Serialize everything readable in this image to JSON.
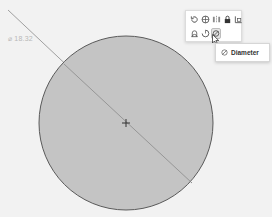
{
  "viewport": {
    "background": "#f2f2f2",
    "circle": {
      "cx": 126,
      "cy": 123,
      "r": 87,
      "fill": "#c4c4c4",
      "stroke": "#5a5a5a"
    },
    "diameter_line": {
      "x1": 8,
      "y1": 10,
      "x2": 192,
      "y2": 183,
      "color": "#8a8a8a"
    },
    "center_mark": "crosshair",
    "dimension_label": "⌀ 18.32"
  },
  "toolbar": {
    "row1": [
      {
        "icon": "rotate-icon"
      },
      {
        "icon": "globe-icon"
      },
      {
        "icon": "mirror-icon"
      },
      {
        "icon": "lock-icon"
      },
      {
        "icon": "scale-icon"
      }
    ],
    "row2": [
      {
        "icon": "radius-icon"
      },
      {
        "icon": "arc-icon"
      },
      {
        "icon": "diameter-icon",
        "hover": true
      }
    ]
  },
  "tooltip": {
    "icon": "diameter-icon",
    "label": "Diameter"
  }
}
